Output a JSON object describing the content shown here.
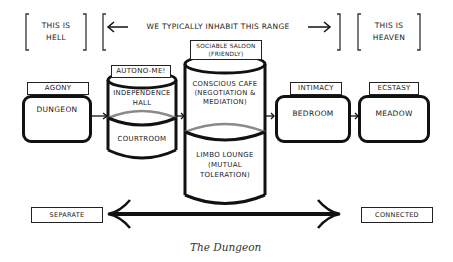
{
  "top_row": {
    "hell": {
      "line1": "THIS IS",
      "line2": "HELL"
    },
    "range": {
      "label": "WE TYPICALLY INHABIT THIS RANGE"
    },
    "heaven": {
      "line1": "THIS IS",
      "line2": "HEAVEN"
    }
  },
  "rooms": [
    {
      "tab": "AGONY",
      "name": "DUNGEON"
    },
    {
      "tab": "AUTONO-ME!",
      "upper": [
        "INDEPENDENCE",
        "HALL"
      ],
      "lower": [
        "COURTROOM"
      ]
    },
    {
      "tab": [
        "SOCIABLE SALOON",
        "(FRIENDLY)"
      ],
      "upper": [
        "CONSCIOUS CAFE",
        "(NEGOTIATION &",
        "MEDIATION)"
      ],
      "lower": [
        "LIMBO LOUNGE",
        "(MUTUAL",
        "TOLERATION)"
      ]
    },
    {
      "tab": "INTIMACY",
      "name": "BEDROOM"
    },
    {
      "tab": "ECSTASY",
      "name": "MEADOW"
    }
  ],
  "scale": {
    "left": "SEPARATE",
    "right": "CONNECTED"
  },
  "caption": "The Dungeon",
  "colors": {
    "ink": "#111111",
    "divider": "#8a8a8a",
    "background": "#ffffff"
  }
}
